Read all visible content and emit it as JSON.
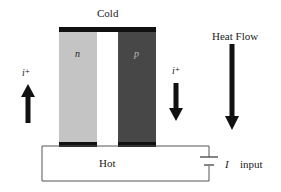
{
  "diagram": {
    "title_top": "Cold",
    "bottom_label": "Hot",
    "legs": [
      {
        "label": "n",
        "color": "#c4c4c4"
      },
      {
        "label": "p",
        "color": "#474747"
      }
    ],
    "current_labels": {
      "left": "i⁺",
      "right": "i⁺"
    },
    "heat_flow_label": "Heat Flow",
    "source": {
      "symbol": "I",
      "label": "input"
    },
    "colors": {
      "conductor": "#111111",
      "wire": "#555555",
      "arrow": "#111111"
    }
  }
}
